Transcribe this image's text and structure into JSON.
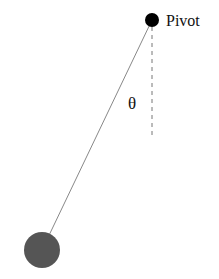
{
  "diagram": {
    "type": "pendulum",
    "labels": {
      "pivot": "Pivot",
      "angle": "θ"
    },
    "colors": {
      "pivot": "#000000",
      "bob": "#555555",
      "string": "#888888",
      "reference_line": "#777777"
    },
    "geometry": {
      "pivot": {
        "x": 152,
        "y": 20,
        "r": 7
      },
      "bob": {
        "x": 42,
        "y": 250,
        "r": 18
      },
      "reference_line": {
        "x": 152,
        "y1": 27,
        "y2": 135
      }
    }
  }
}
